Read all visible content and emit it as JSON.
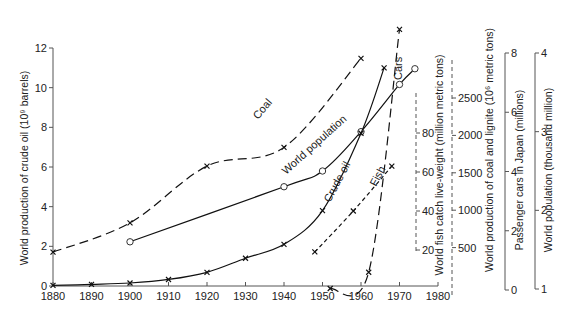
{
  "chart_data": {
    "type": "line",
    "title": "",
    "xlabel": "",
    "x_ticks": [
      1880,
      1890,
      1900,
      1910,
      1920,
      1930,
      1940,
      1950,
      1960,
      1970,
      1980
    ],
    "xlim": [
      1880,
      1980
    ],
    "axes": [
      {
        "id": "oil",
        "label": "World production of crude oil (10⁹ barrels)",
        "side": "left",
        "ticks": [
          0,
          2,
          4,
          6,
          8,
          10,
          12
        ],
        "range": [
          0,
          12
        ]
      },
      {
        "id": "fish",
        "label": "World fish catch live-weight (million metric tons)",
        "side": "right",
        "style": "dashed",
        "ticks": [
          20,
          40,
          60,
          80
        ],
        "range": [
          20,
          80
        ]
      },
      {
        "id": "coal",
        "label": "World production of coal and lignite (10⁶ metric tons)",
        "side": "right",
        "style": "dashed",
        "ticks": [
          500,
          1000,
          1500,
          2000,
          2500
        ],
        "range": [
          0,
          2500
        ]
      },
      {
        "id": "cars",
        "label": "Passenger cars in Japan (millions)",
        "side": "right",
        "ticks": [
          0,
          2,
          4,
          6,
          8
        ],
        "range": [
          0,
          8
        ]
      },
      {
        "id": "pop",
        "label": "World population (thousand million)",
        "side": "right",
        "ticks": [
          1,
          2,
          3,
          4
        ],
        "range": [
          1,
          4
        ]
      }
    ],
    "series": [
      {
        "name": "Coal",
        "axis": "coal",
        "style": "long-dash",
        "marker": "x",
        "x": [
          1880,
          1900,
          1920,
          1940,
          1960
        ],
        "y": [
          440,
          830,
          1590,
          1840,
          3030
        ]
      },
      {
        "name": "World population",
        "axis": "pop",
        "style": "solid",
        "marker": "o",
        "x": [
          1900,
          1940,
          1950,
          1960,
          1970,
          1974
        ],
        "y": [
          1.6,
          2.3,
          2.5,
          3.0,
          3.6,
          3.8
        ]
      },
      {
        "name": "Crude oil",
        "axis": "oil",
        "style": "solid",
        "marker": "x",
        "x": [
          1880,
          1890,
          1900,
          1910,
          1920,
          1930,
          1940,
          1950,
          1960,
          1966
        ],
        "y": [
          0.03,
          0.08,
          0.15,
          0.33,
          0.69,
          1.4,
          2.1,
          3.8,
          7.7,
          11.0
        ]
      },
      {
        "name": "Fish",
        "axis": "fish",
        "style": "short-dash",
        "marker": "x",
        "x": [
          1948,
          1958,
          1968
        ],
        "y": [
          19,
          40,
          63
        ]
      },
      {
        "name": "Cars",
        "axis": "cars",
        "style": "long-dash",
        "marker": "x",
        "x": [
          1952,
          1962,
          1970
        ],
        "y": [
          0.05,
          0.6,
          8.8
        ]
      }
    ],
    "annotations": [
      "Coal",
      "World population",
      "Crude oil",
      "Fish",
      "Cars"
    ],
    "grid": false,
    "legend": "inline labels"
  },
  "labels": {
    "oil_axis": "World production of crude oil (10⁹ barrels)",
    "fish_axis": "World fish catch live-weight (million metric tons)",
    "coal_axis": "World production of coal and lignite (10⁶ metric tons)",
    "cars_axis": "Passenger cars in Japan (millions)",
    "pop_axis": "World population (thousand million)",
    "coal": "Coal",
    "pop": "World population",
    "oil": "Crude oil",
    "fish": "Fish",
    "cars": "Cars"
  }
}
